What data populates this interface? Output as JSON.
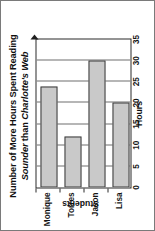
{
  "chart_data": {
    "type": "bar",
    "orientation": "horizontal",
    "title": "Number of More Hours Spent Reading Sounder than Charlotte's Web",
    "title_line1": "Number of More Hours Spent Reading",
    "title_line2_italic_a": "Sounder",
    "title_line2_roman": " than ",
    "title_line2_italic_b": "Charlotte's Web",
    "categories": [
      "Lisa",
      "Jason",
      "Torres",
      "Monique"
    ],
    "values": [
      20,
      30,
      12,
      24
    ],
    "xlabel": "Hours",
    "ylabel": "Students",
    "xlim": [
      0,
      35
    ],
    "xticks": [
      0,
      5,
      10,
      15,
      20,
      25,
      30,
      35
    ],
    "xtick_labels": [
      "0",
      "5",
      "10",
      "15",
      "20",
      "25",
      "30",
      "35"
    ],
    "grid": true,
    "legend": false,
    "bar_fill_color": "#c9c9c9",
    "bar_border_color": "#3a3a3a",
    "gridline_color": "#6f6f6f",
    "axis_color": "#2a2a2a"
  }
}
